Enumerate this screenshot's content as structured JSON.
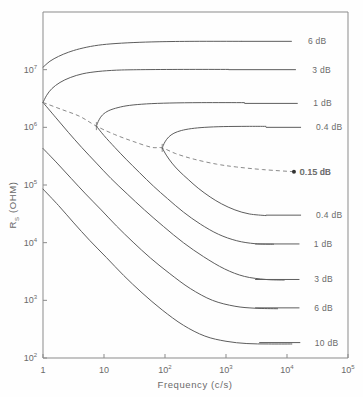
{
  "chart_data": {
    "type": "line",
    "title": "",
    "xlabel": "Frequency (c/s)",
    "ylabel": "R_S (OHM)",
    "ylabel_base": "R",
    "ylabel_sub": "S",
    "ylabel_unit": "(OHM)",
    "xscale": "log",
    "yscale": "log",
    "xlim": [
      1,
      100000
    ],
    "ylim": [
      100,
      100000000
    ],
    "grid": false,
    "legend_position": "inline-right-labels",
    "xticks": [
      {
        "value": 1,
        "label": "1",
        "mantissa": "",
        "exponent": ""
      },
      {
        "value": 10,
        "label": "10",
        "mantissa": "10",
        "exponent": ""
      },
      {
        "value": 100,
        "label": "10^2",
        "mantissa": "10",
        "exponent": "2"
      },
      {
        "value": 1000,
        "label": "10^3",
        "mantissa": "10",
        "exponent": "3"
      },
      {
        "value": 10000,
        "label": "10^4",
        "mantissa": "10",
        "exponent": "4"
      },
      {
        "value": 100000,
        "label": "10^5",
        "mantissa": "10",
        "exponent": "5"
      }
    ],
    "yticks": [
      {
        "value": 100,
        "label": "10^2",
        "mantissa": "10",
        "exponent": "2"
      },
      {
        "value": 1000,
        "label": "10^3",
        "mantissa": "10",
        "exponent": "3"
      },
      {
        "value": 10000,
        "label": "10^4",
        "mantissa": "10",
        "exponent": "4"
      },
      {
        "value": 100000,
        "label": "10^5",
        "mantissa": "10",
        "exponent": "5"
      },
      {
        "value": 1000000,
        "label": "10^6",
        "mantissa": "10",
        "exponent": "6"
      },
      {
        "value": 10000000,
        "label": "10^7",
        "mantissa": "10",
        "exponent": "7"
      }
    ],
    "annotations": [
      {
        "name": "optimum-source-resistance-point",
        "x": 13000,
        "y": 170000,
        "label": "0.15 dB",
        "marker": "filled-dot"
      }
    ],
    "series": [
      {
        "name": "noise-contour-6db-upper",
        "label": "6 dB",
        "style": "solid",
        "label_x": 22000,
        "label_y": 31000000,
        "leader_from_x": 1800,
        "leader_to_x": 12000,
        "leader_y": 31000000,
        "points": [
          [
            1,
            11000000
          ],
          [
            1.3,
            14000000
          ],
          [
            1.8,
            17000000
          ],
          [
            2.6,
            20000000
          ],
          [
            4,
            23000000
          ],
          [
            7,
            26000000
          ],
          [
            13,
            28000000
          ],
          [
            30,
            29500000
          ],
          [
            80,
            30500000
          ],
          [
            300,
            31000000
          ],
          [
            1800,
            31000000
          ]
        ]
      },
      {
        "name": "noise-contour-3db-upper",
        "label": "3 dB",
        "style": "solid",
        "label_x": 26000,
        "label_y": 10000000,
        "leader_from_x": 1100,
        "leader_to_x": 14000,
        "leader_y": 10000000,
        "points": [
          [
            1,
            2700000
          ],
          [
            1.15,
            3600000
          ],
          [
            1.4,
            4700000
          ],
          [
            1.9,
            6000000
          ],
          [
            2.8,
            7300000
          ],
          [
            4.5,
            8500000
          ],
          [
            8,
            9300000
          ],
          [
            16,
            9800000
          ],
          [
            40,
            10000000
          ],
          [
            200,
            10100000
          ],
          [
            1100,
            10100000
          ]
        ]
      },
      {
        "name": "noise-contour-1db-upper",
        "label": "1 dB",
        "style": "solid",
        "label_x": 27000,
        "label_y": 2600000,
        "leader_from_x": 2000,
        "leader_to_x": 15000,
        "leader_y": 2600000,
        "points": [
          [
            7.5,
            1050000
          ],
          [
            8.3,
            1350000
          ],
          [
            9.5,
            1650000
          ],
          [
            12,
            1950000
          ],
          [
            17,
            2200000
          ],
          [
            26,
            2400000
          ],
          [
            50,
            2550000
          ],
          [
            120,
            2640000
          ],
          [
            400,
            2680000
          ],
          [
            2000,
            2680000
          ]
        ],
        "nose": [
          7.5,
          1050000
        ]
      },
      {
        "name": "noise-contour-04db-upper",
        "label": "0.4 dB",
        "style": "solid",
        "label_x": 30000,
        "label_y": 1000000,
        "leader_from_x": 4500,
        "leader_to_x": 17000,
        "leader_y": 1000000,
        "points": [
          [
            90,
            440000
          ],
          [
            100,
            560000
          ],
          [
            115,
            680000
          ],
          [
            140,
            790000
          ],
          [
            185,
            880000
          ],
          [
            270,
            950000
          ],
          [
            450,
            1000000
          ],
          [
            900,
            1030000
          ],
          [
            2200,
            1040000
          ],
          [
            4500,
            1040000
          ]
        ],
        "nose": [
          90,
          440000
        ]
      },
      {
        "name": "noise-contour-015db-optimum",
        "label": "0.15 dB",
        "style": "dashed",
        "label_x": 16000,
        "label_y": 170000,
        "points": [
          [
            1,
            2700000
          ],
          [
            2,
            2050000
          ],
          [
            4,
            1550000
          ],
          [
            7.5,
            1050000
          ],
          [
            15,
            750000
          ],
          [
            30,
            570000
          ],
          [
            60,
            450000
          ],
          [
            90,
            440000
          ],
          [
            150,
            350000
          ],
          [
            300,
            280000
          ],
          [
            700,
            230000
          ],
          [
            1500,
            205000
          ],
          [
            4000,
            185000
          ],
          [
            13000,
            170000
          ]
        ]
      },
      {
        "name": "noise-contour-04db-lower",
        "label": "0.4 dB",
        "style": "solid",
        "label_x": 30000,
        "label_y": 30000,
        "leader_from_x": 4500,
        "leader_to_x": 17000,
        "leader_y": 30000,
        "points": [
          [
            90,
            440000
          ],
          [
            105,
            330000
          ],
          [
            130,
            240000
          ],
          [
            170,
            175000
          ],
          [
            240,
            125000
          ],
          [
            350,
            88000
          ],
          [
            550,
            62000
          ],
          [
            850,
            47000
          ],
          [
            1400,
            37000
          ],
          [
            2400,
            31500
          ],
          [
            4500,
            29500
          ]
        ]
      },
      {
        "name": "noise-contour-1db-lower",
        "label": "1 dB",
        "style": "solid",
        "label_x": 27500,
        "label_y": 9500,
        "leader_from_x": 3000,
        "leader_to_x": 16000,
        "leader_y": 9500,
        "points": [
          [
            7.5,
            1050000
          ],
          [
            10,
            720000
          ],
          [
            15,
            450000
          ],
          [
            23,
            280000
          ],
          [
            38,
            165000
          ],
          [
            65,
            95000
          ],
          [
            110,
            58000
          ],
          [
            200,
            34000
          ],
          [
            380,
            21000
          ],
          [
            750,
            14000
          ],
          [
            1500,
            10800
          ],
          [
            3000,
            9600
          ],
          [
            6000,
            9400
          ]
        ]
      },
      {
        "name": "noise-contour-3db-lower",
        "label": "3 dB",
        "style": "solid",
        "label_x": 28000,
        "label_y": 2300,
        "leader_from_x": 3000,
        "leader_to_x": 16000,
        "leader_y": 2300,
        "points": [
          [
            1,
            2700000
          ],
          [
            1.6,
            1500000
          ],
          [
            2.6,
            820000
          ],
          [
            4.3,
            450000
          ],
          [
            7.5,
            240000
          ],
          [
            13,
            130000
          ],
          [
            24,
            70000
          ],
          [
            46,
            37000
          ],
          [
            95,
            19000
          ],
          [
            200,
            10000
          ],
          [
            430,
            5700
          ],
          [
            950,
            3500
          ],
          [
            2000,
            2600
          ],
          [
            4500,
            2300
          ],
          [
            9000,
            2250
          ]
        ]
      },
      {
        "name": "noise-contour-6db-lower",
        "label": "6 dB",
        "style": "solid",
        "label_x": 28000,
        "label_y": 740,
        "leader_from_x": 3000,
        "leader_to_x": 16000,
        "leader_y": 740,
        "points": [
          [
            1,
            430000
          ],
          [
            1.7,
            240000
          ],
          [
            2.9,
            130000
          ],
          [
            5,
            70000
          ],
          [
            9,
            37000
          ],
          [
            16,
            19500
          ],
          [
            30,
            10200
          ],
          [
            58,
            5400
          ],
          [
            120,
            2900
          ],
          [
            260,
            1600
          ],
          [
            600,
            1000
          ],
          [
            1400,
            790
          ],
          [
            3000,
            730
          ],
          [
            7000,
            715
          ]
        ]
      },
      {
        "name": "noise-contour-10db-lower",
        "label": "10 dB",
        "style": "solid",
        "label_x": 28500,
        "label_y": 185,
        "leader_from_x": 3500,
        "leader_to_x": 16500,
        "leader_y": 185,
        "points": [
          [
            1,
            85000
          ],
          [
            1.8,
            44000
          ],
          [
            3.2,
            22000
          ],
          [
            5.8,
            11000
          ],
          [
            11,
            5500
          ],
          [
            21,
            2700
          ],
          [
            42,
            1350
          ],
          [
            90,
            680
          ],
          [
            200,
            370
          ],
          [
            450,
            240
          ],
          [
            1000,
            195
          ],
          [
            2200,
            178
          ],
          [
            5000,
            175
          ],
          [
            12000,
            175
          ]
        ]
      }
    ]
  }
}
